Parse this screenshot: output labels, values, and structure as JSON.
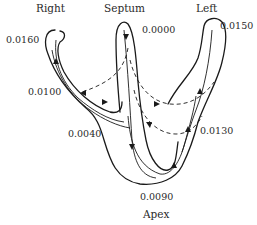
{
  "diagram": {
    "type": "heart-conduction-sequence",
    "regions": {
      "right": "Right",
      "septum": "Septum",
      "left": "Left",
      "apex": "Apex"
    },
    "timings": {
      "right_top": "0.0160",
      "right_mid": "0.0100",
      "septum_top": "0.0000",
      "left_top": "0.0150",
      "left_mid": "0.0130",
      "septum_base": "0.0040",
      "apex": "0.0090"
    },
    "colors": {
      "line": "#1a1a1a",
      "text": "#2a2a2a",
      "background": "#ffffff"
    }
  }
}
